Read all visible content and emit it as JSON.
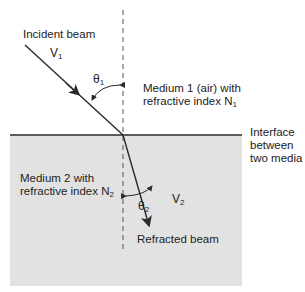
{
  "colors": {
    "medium2_fill": "#e2e2e2",
    "line": "#2a2a2a",
    "background": "#ffffff"
  },
  "labels": {
    "incident_beam": "Incident beam",
    "v1": "V",
    "v1_sub": "1",
    "theta1": "θ",
    "theta1_sub": "1",
    "medium1_line1": "Medium 1 (air) with",
    "medium1_line2": "refractive index N",
    "medium1_sub": "1",
    "interface_line1": "Interface",
    "interface_line2": "between",
    "interface_line3": "two media",
    "medium2_line1": "Medium 2 with",
    "medium2_line2": "refractive index N",
    "medium2_sub": "2",
    "theta2": "θ",
    "theta2_sub": "2",
    "v2": "V",
    "v2_sub": "2",
    "refracted_beam": "Refracted beam"
  }
}
